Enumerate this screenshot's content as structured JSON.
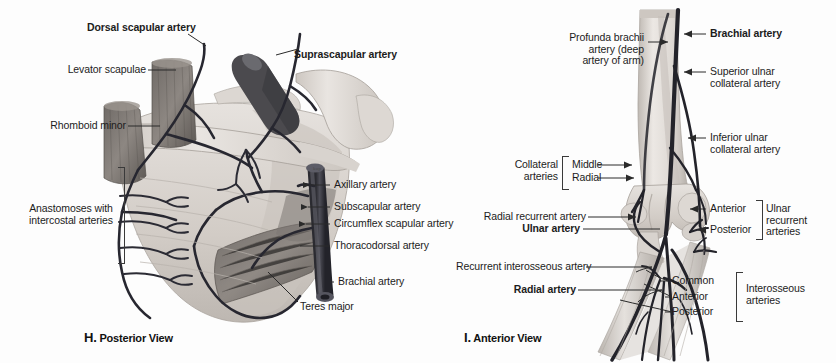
{
  "plate": {
    "background": "#fdfdfd",
    "ink": "#1c1c1c",
    "artery_color": "#3a3a42",
    "bone_color": "#e0dbd6",
    "muscle_color": "#8d8781"
  },
  "figure_h": {
    "caption_letter": "H.",
    "caption_text": " Posterior View",
    "signature": "kup",
    "labels": [
      {
        "id": "dorsal-scapular-artery",
        "text": "Dorsal scapular artery",
        "bold": true
      },
      {
        "id": "suprascapular-artery",
        "text": "Suprascapular artery",
        "bold": true
      },
      {
        "id": "levator-scapulae",
        "text": "Levator scapulae",
        "bold": false
      },
      {
        "id": "rhomboid-minor",
        "text": "Rhomboid minor",
        "bold": false
      },
      {
        "id": "anastomoses-intercostal",
        "text": "Anastomoses with\nintercostal arteries",
        "bold": false
      },
      {
        "id": "axillary-artery",
        "text": "Axillary artery",
        "bold": false
      },
      {
        "id": "subscapular-artery",
        "text": "Subscapular artery",
        "bold": false
      },
      {
        "id": "circumflex-scapular-artery",
        "text": "Circumflex scapular artery",
        "bold": false
      },
      {
        "id": "thoracodorsal-artery",
        "text": "Thoracodorsal artery",
        "bold": false
      },
      {
        "id": "brachial-artery",
        "text": "Brachial artery",
        "bold": false
      },
      {
        "id": "teres-major",
        "text": "Teres major",
        "bold": false
      }
    ]
  },
  "figure_i": {
    "caption_letter": "I.",
    "caption_text": " Anterior View",
    "labels": [
      {
        "id": "profunda-brachii",
        "text": "Profunda brachii\nartery (deep\nartery of arm)",
        "bold": false
      },
      {
        "id": "brachial-artery",
        "text": "Brachial artery",
        "bold": true
      },
      {
        "id": "superior-ulnar-collateral",
        "text": "Superior ulnar\ncollateral artery",
        "bold": false
      },
      {
        "id": "inferior-ulnar-collateral",
        "text": "Inferior ulnar\ncollateral artery",
        "bold": false
      },
      {
        "id": "collateral-arteries-group",
        "text": "Collateral\narteries",
        "bold": false
      },
      {
        "id": "collateral-middle",
        "text": "Middle",
        "bold": false
      },
      {
        "id": "collateral-radial",
        "text": "Radial",
        "bold": false
      },
      {
        "id": "radial-recurrent-artery",
        "text": "Radial recurrent artery",
        "bold": false
      },
      {
        "id": "ulnar-artery",
        "text": "Ulnar artery",
        "bold": true
      },
      {
        "id": "recurrent-interosseous-artery",
        "text": "Recurrent interosseous artery",
        "bold": false
      },
      {
        "id": "radial-artery",
        "text": "Radial artery",
        "bold": true
      },
      {
        "id": "ulnar-recurrent-anterior",
        "text": "Anterior",
        "bold": false
      },
      {
        "id": "ulnar-recurrent-posterior",
        "text": "Posterior",
        "bold": false
      },
      {
        "id": "ulnar-recurrent-group",
        "text": "Ulnar\nrecurrent\narteries",
        "bold": false
      },
      {
        "id": "interosseous-common",
        "text": "Common",
        "bold": false
      },
      {
        "id": "interosseous-anterior",
        "text": "Anterior",
        "bold": false
      },
      {
        "id": "interosseous-posterior",
        "text": "Posterior",
        "bold": false
      },
      {
        "id": "interosseous-group",
        "text": "Interosseous\narteries",
        "bold": false
      }
    ]
  }
}
